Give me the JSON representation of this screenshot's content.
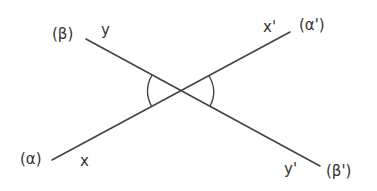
{
  "diagram": {
    "colors": {
      "line": "#444444",
      "text": "#333333",
      "background": "#ffffff"
    },
    "lines": [
      {
        "id": "line-beta",
        "start": {
          "x": 86,
          "y": 39
        },
        "end": {
          "x": 320,
          "y": 166
        },
        "start_name": "(β)",
        "end_name": "(β')",
        "start_ray": "y",
        "end_ray": "y'"
      },
      {
        "id": "line-alpha",
        "start": {
          "x": 52,
          "y": 160
        },
        "end": {
          "x": 290,
          "y": 32
        },
        "start_name": "(α)",
        "end_name": "(α')",
        "start_ray": "x",
        "end_ray": "x'"
      }
    ],
    "intersection": {
      "x": 182,
      "y": 91
    },
    "angle_arcs": [
      {
        "id": "left-angle",
        "side": "left"
      },
      {
        "id": "right-angle",
        "side": "right"
      }
    ],
    "labels": {
      "beta": "(β)",
      "y": "y",
      "x_prime": "x'",
      "alpha_prime": "(α')",
      "alpha": "(α)",
      "x": "x",
      "y_prime": "y'",
      "beta_prime": "(β')"
    }
  }
}
